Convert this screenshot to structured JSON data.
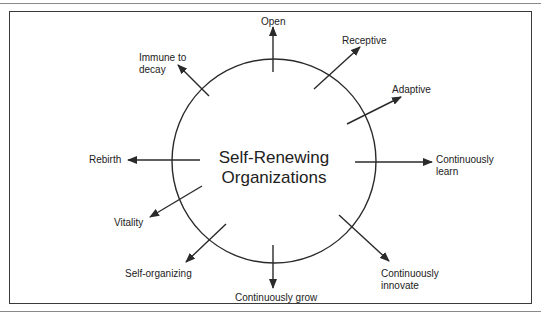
{
  "diagram": {
    "type": "radial-concept",
    "center_label": [
      "Self-Renewing",
      "Organizations"
    ],
    "colors": {
      "line": "#2a2a2a",
      "text": "#222222",
      "frame": "#3a3a3a"
    },
    "spokes": [
      {
        "id": "open",
        "label": [
          "Open"
        ]
      },
      {
        "id": "receptive",
        "label": [
          "Receptive"
        ]
      },
      {
        "id": "adaptive",
        "label": [
          "Adaptive"
        ]
      },
      {
        "id": "continuously-learn",
        "label": [
          "Continuously",
          "learn"
        ]
      },
      {
        "id": "continuously-innovate",
        "label": [
          "Continuously",
          "innovate"
        ]
      },
      {
        "id": "continuously-grow",
        "label": [
          "Continuously grow"
        ]
      },
      {
        "id": "self-organizing",
        "label": [
          "Self-organizing"
        ]
      },
      {
        "id": "vitality",
        "label": [
          "Vitality"
        ]
      },
      {
        "id": "rebirth",
        "label": [
          "Rebirth"
        ]
      },
      {
        "id": "immune-to-decay",
        "label": [
          "Immune to",
          "decay"
        ]
      }
    ]
  }
}
